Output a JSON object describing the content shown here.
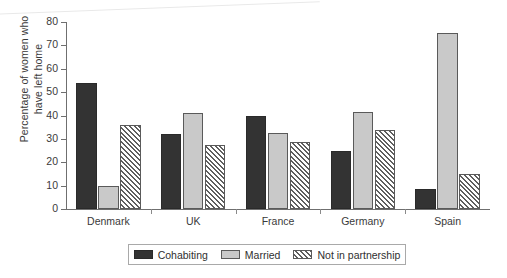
{
  "chart_data": {
    "type": "bar",
    "title": "",
    "xlabel": "",
    "ylabel": "Percentage of women who have left home",
    "ylabel_line1": "Percentage of women who",
    "ylabel_line2": "have left home",
    "ylim": [
      0,
      80
    ],
    "yticks": [
      0,
      10,
      20,
      30,
      40,
      50,
      60,
      70,
      80
    ],
    "ytick_labels": [
      "0",
      "10",
      "20",
      "30",
      "40",
      "50",
      "60",
      "70",
      "80"
    ],
    "grid": false,
    "legend_position": "bottom",
    "categories": [
      "Denmark",
      "UK",
      "France",
      "Germany",
      "Spain"
    ],
    "series": [
      {
        "name": "Cohabiting",
        "pattern": "solid-dark",
        "color": "#333333",
        "values": [
          54,
          32,
          40,
          25,
          8.5
        ]
      },
      {
        "name": "Married",
        "pattern": "solid-light",
        "color": "#c9c9c9",
        "values": [
          10,
          41,
          32.5,
          41.5,
          75.5
        ]
      },
      {
        "name": "Not in partnership",
        "pattern": "diagonal-hatch",
        "color": "#ffffff",
        "values": [
          36,
          27.5,
          28.5,
          34,
          15
        ]
      }
    ]
  },
  "legend": {
    "entries": [
      {
        "label": "Cohabiting"
      },
      {
        "label": "Married"
      },
      {
        "label": "Not in partnership"
      }
    ]
  }
}
